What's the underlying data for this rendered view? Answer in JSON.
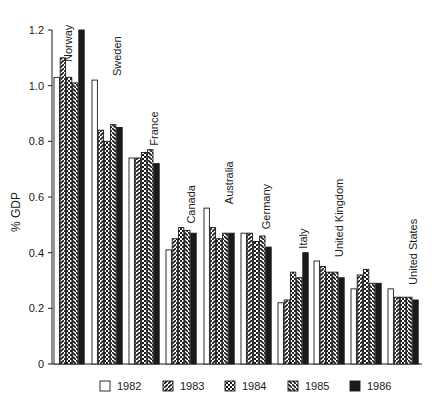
{
  "chart_data": {
    "type": "bar",
    "title": "",
    "xlabel": "",
    "ylabel": "% GDP",
    "ylim": [
      0,
      1.2
    ],
    "yticks": [
      0,
      0.2,
      0.4,
      0.6,
      0.8,
      1.0,
      1.2
    ],
    "ytick_labels": [
      "0",
      "0.2",
      "0.4",
      "0.6",
      "0.8",
      "1.0",
      "1.2"
    ],
    "grid": false,
    "legend_position": "bottom",
    "categories": [
      "Norway",
      "Sweden",
      "France",
      "Canada",
      "Australia",
      "Germany",
      "Italy",
      "United Kingdom",
      "",
      "United States"
    ],
    "series": [
      {
        "name": "1982",
        "pattern": "open",
        "values": [
          1.03,
          1.02,
          0.74,
          0.41,
          0.56,
          0.47,
          0.22,
          0.37,
          0.27,
          0.27
        ]
      },
      {
        "name": "1983",
        "pattern": "diagonal",
        "values": [
          1.1,
          0.84,
          0.74,
          0.45,
          0.49,
          0.47,
          0.23,
          0.35,
          0.32,
          0.24
        ]
      },
      {
        "name": "1984",
        "pattern": "checkered",
        "values": [
          1.03,
          0.8,
          0.76,
          0.49,
          0.45,
          0.44,
          0.33,
          0.33,
          0.34,
          0.24
        ]
      },
      {
        "name": "1985",
        "pattern": "back-diagonal",
        "values": [
          1.01,
          0.86,
          0.77,
          0.48,
          0.47,
          0.46,
          0.31,
          0.33,
          0.29,
          0.24
        ]
      },
      {
        "name": "1986",
        "pattern": "solid",
        "values": [
          1.2,
          0.85,
          0.72,
          0.47,
          0.47,
          0.42,
          0.4,
          0.31,
          0.29,
          0.23
        ]
      }
    ]
  },
  "axis": {
    "ylabel": "% GDP"
  },
  "legend": [
    {
      "label": "1982"
    },
    {
      "label": "1983"
    },
    {
      "label": "1984"
    },
    {
      "label": "1985"
    },
    {
      "label": "1986"
    }
  ],
  "colors": {
    "ink": "#1a1a1a",
    "paper": "#ffffff"
  }
}
